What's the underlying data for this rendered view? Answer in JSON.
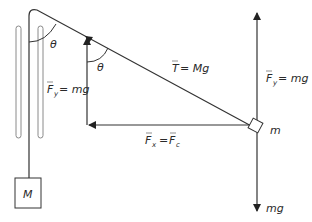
{
  "diagram": {
    "type": "physics-force-diagram",
    "colors": {
      "line": "#333333",
      "pulley_outline": "#8a8a8a",
      "text": "#2a2a2a",
      "background": "#ffffff"
    },
    "labels": {
      "theta_top": "θ",
      "theta_arrow": "θ",
      "tension": "T = Mg",
      "tension_symbol": "T",
      "tension_rhs": "= Mg",
      "fy_left_symbol": "F",
      "fy_left_sub": "y",
      "fy_left_rhs": "= mg",
      "fy_right_symbol": "F",
      "fy_right_sub": "y",
      "fy_right_rhs": "= mg",
      "fx_symbol": "F",
      "fx_sub": "x",
      "fx_eq": "=",
      "fc_symbol": "F",
      "fc_sub": "c",
      "mass_small": "m",
      "mass_large": "M",
      "weight": "mg"
    }
  }
}
